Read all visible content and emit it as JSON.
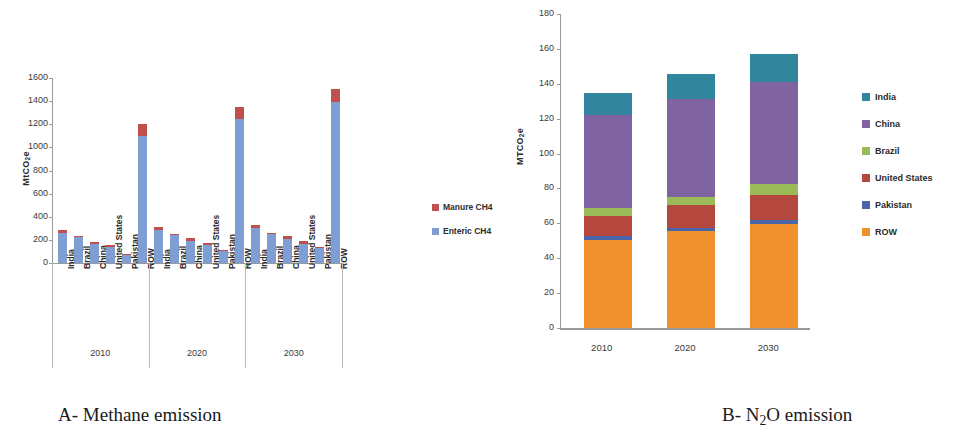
{
  "figure": {
    "captions": {
      "a": "A-  Methane emission",
      "b_prefix": "B- N",
      "b_sub": "2",
      "b_suffix": "O  emission"
    }
  },
  "chart_data": [
    {
      "id": "chart-a",
      "type": "bar",
      "stacked": true,
      "title": "",
      "caption": "A-  Methane emission",
      "xlabel": "",
      "ylabel": "MtCO2e",
      "ylabel_display": "MtCO",
      "ylabel_sub": "2",
      "ylabel_tail": "e",
      "ylim": [
        0,
        1600
      ],
      "yticks": [
        0,
        200,
        400,
        600,
        800,
        1000,
        1200,
        1400,
        1600
      ],
      "ytick_labels": [
        "0",
        "200",
        "400",
        "600",
        "800",
        "1000",
        "1200",
        "1400",
        "1600"
      ],
      "grid": false,
      "legend_position": "right",
      "groups": [
        "2010",
        "2020",
        "2030"
      ],
      "categories": [
        "India",
        "Brazil",
        "China",
        "United States",
        "Pakistan",
        "ROW"
      ],
      "series": [
        {
          "name": "Enteric CH4",
          "color": "#7f9fd4",
          "values_by_group": {
            "2010": [
              262,
              228,
              168,
              140,
              78,
              1100
            ],
            "2020": [
              288,
              248,
              192,
              155,
              105,
              1245
            ],
            "2030": [
              305,
              250,
              212,
              165,
              130,
              1390
            ]
          }
        },
        {
          "name": "Manure CH4",
          "color": "#c0504d",
          "values_by_group": {
            "2010": [
              22,
              5,
              18,
              18,
              3,
              100
            ],
            "2020": [
              24,
              6,
              22,
              22,
              4,
              100
            ],
            "2030": [
              28,
              6,
              24,
              22,
              5,
              115
            ]
          }
        }
      ],
      "legend": [
        {
          "label": "Manure CH4",
          "color": "#c0504d"
        },
        {
          "label": "Enteric CH4",
          "color": "#7f9fd4"
        }
      ]
    },
    {
      "id": "chart-b",
      "type": "bar",
      "stacked": true,
      "title": "",
      "caption": "B- N2O emission",
      "xlabel": "",
      "ylabel": "MTCO2e",
      "ylabel_display": "MTCO",
      "ylabel_sub": "2",
      "ylabel_tail": "e",
      "ylim": [
        0,
        180
      ],
      "yticks": [
        0,
        20,
        40,
        60,
        80,
        100,
        120,
        140,
        160,
        180
      ],
      "ytick_labels": [
        "0",
        "20",
        "40",
        "60",
        "80",
        "100",
        "120",
        "140",
        "160",
        "180"
      ],
      "grid": false,
      "legend_position": "right",
      "categories": [
        "2010",
        "2020",
        "2030"
      ],
      "series": [
        {
          "name": "ROW",
          "color": "#f0912d",
          "values": [
            50.5,
            55.5,
            59.5
          ]
        },
        {
          "name": "Pakistan",
          "color": "#4a66a8",
          "values": [
            2.3,
            2.0,
            2.3
          ]
        },
        {
          "name": "United States",
          "color": "#b4483f",
          "values": [
            11.5,
            13.0,
            14.5
          ]
        },
        {
          "name": "Brazil",
          "color": "#9bbb59",
          "values": [
            4.3,
            4.5,
            6.5
          ]
        },
        {
          "name": "China",
          "color": "#8064a2",
          "values": [
            53.4,
            56.5,
            58.2
          ]
        },
        {
          "name": "India",
          "color": "#31859c",
          "values": [
            12.8,
            14.0,
            16.0
          ]
        }
      ],
      "legend": [
        {
          "label": "India",
          "color": "#31859c"
        },
        {
          "label": "China",
          "color": "#8064a2"
        },
        {
          "label": "Brazil",
          "color": "#9bbb59"
        },
        {
          "label": "United States",
          "color": "#b4483f"
        },
        {
          "label": "Pakistan",
          "color": "#4a66a8"
        },
        {
          "label": "ROW",
          "color": "#f0912d"
        }
      ]
    }
  ]
}
